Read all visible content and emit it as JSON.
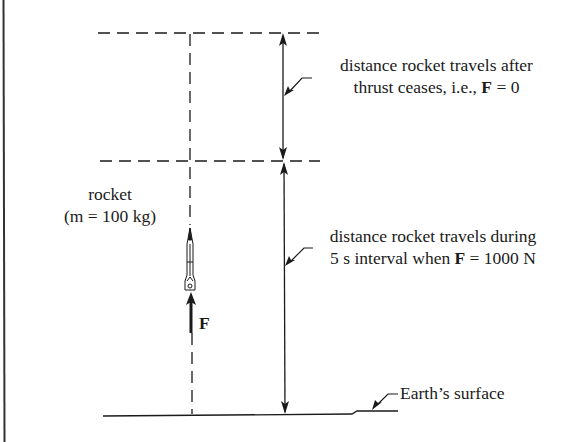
{
  "diagram": {
    "labels": {
      "rocket_title": "rocket",
      "rocket_mass": "(m = 100 kg)",
      "force_symbol": "F",
      "after_line1": "distance rocket travels after",
      "after_line2_prefix": "thrust ceases, i.e., ",
      "after_line2_bold": "F",
      "after_line2_suffix": " = 0",
      "during_line1": "distance rocket travels during",
      "during_line2_prefix": "5 s interval when ",
      "during_line2_bold": "F",
      "during_line2_suffix": " = 1000 N",
      "ground": "Earth’s surface"
    },
    "colors": {
      "line": "#1a1a1a",
      "background": "#ffffff"
    },
    "values": {
      "mass_kg": 100,
      "thrust_N": 1000,
      "interval_s": 5,
      "force_after": 0
    }
  }
}
